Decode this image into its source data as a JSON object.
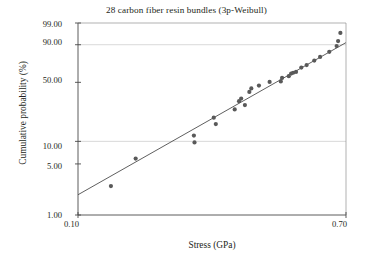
{
  "chart_data": {
    "type": "scatter",
    "title": "28 carbon fiber resin bundles (3p-Weibull)",
    "xlabel": "Stress (GPa)",
    "ylabel": "Cumulative probability (%)",
    "x_scale": "log",
    "y_scale": "weibull-probability",
    "xlim": [
      0.1,
      0.7
    ],
    "ylim": [
      1.0,
      99.0
    ],
    "grid": "horizontal gridlines at 10.00 and 90.00",
    "legend": "none",
    "xticks": [
      {
        "value": 0.1,
        "label": "0.10"
      },
      {
        "value": 0.7,
        "label": "0.70"
      }
    ],
    "yticks": [
      {
        "value": 99.0,
        "label": "99.00"
      },
      {
        "value": 90.0,
        "label": "90.00"
      },
      {
        "value": 50.0,
        "label": "50.00"
      },
      {
        "value": 10.0,
        "label": "10.00"
      },
      {
        "value": 5.0,
        "label": "5.00"
      },
      {
        "value": 1.0,
        "label": "1.00"
      }
    ],
    "series": [
      {
        "name": "Failure data (median ranks)",
        "marker": "filled-circle",
        "color": "#595959",
        "x": [
          0.127,
          0.152,
          0.232,
          0.233,
          0.268,
          0.272,
          0.312,
          0.322,
          0.327,
          0.336,
          0.347,
          0.352,
          0.372,
          0.402,
          0.436,
          0.44,
          0.462,
          0.47,
          0.477,
          0.487,
          0.506,
          0.526,
          0.556,
          0.58,
          0.62,
          0.654,
          0.661,
          0.672
        ],
        "y": [
          2.5,
          5.9,
          11.9,
          9.7,
          20.1,
          16.7,
          25.3,
          31.6,
          33.8,
          28.5,
          40.0,
          43.5,
          46.5,
          50.5,
          51.0,
          55.0,
          57.0,
          60.0,
          61.0,
          62.0,
          67.0,
          70.0,
          75.0,
          79.0,
          84.0,
          89.0,
          92.5,
          96.5
        ]
      },
      {
        "name": "3p-Weibull fit line",
        "type": "line",
        "color": "#4d4d4d",
        "x": [
          0.1,
          0.7
        ],
        "y": [
          1.9,
          91.5
        ]
      }
    ]
  }
}
